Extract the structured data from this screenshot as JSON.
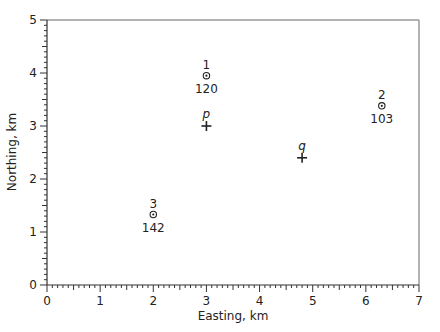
{
  "chart_data": {
    "type": "scatter",
    "title": "",
    "xlabel": "Easting, km",
    "ylabel": "Northing, km",
    "xlim": [
      0,
      7
    ],
    "ylim": [
      0,
      5
    ],
    "xticks": [
      0,
      1,
      2,
      3,
      4,
      5,
      6,
      7
    ],
    "yticks": [
      0,
      1,
      2,
      3,
      4,
      5
    ],
    "minor_ticks_per_unit": 10,
    "grid": false,
    "legend": null,
    "series": [
      {
        "name": "stations",
        "marker": "circle-dot",
        "points": [
          {
            "id": "1",
            "x": 3.0,
            "y": 3.95,
            "value": 120
          },
          {
            "id": "2",
            "x": 6.3,
            "y": 3.38,
            "value": 103
          },
          {
            "id": "3",
            "x": 2.0,
            "y": 1.33,
            "value": 142
          }
        ]
      },
      {
        "name": "query points",
        "marker": "plus",
        "points": [
          {
            "id": "p",
            "x": 3.0,
            "y": 3.0
          },
          {
            "id": "q",
            "x": 4.8,
            "y": 2.4
          }
        ]
      }
    ]
  },
  "colors": {
    "frame": "#9a9a9a",
    "axis": "#333333",
    "marker": "#222222",
    "text": "#222222"
  }
}
